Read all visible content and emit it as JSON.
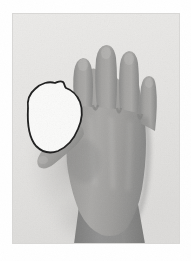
{
  "page": {
    "background_color": "#ffffff",
    "width": 191,
    "height": 261
  },
  "photo": {
    "name": "hand-photograph",
    "left": 12,
    "top": 13,
    "width": 168,
    "height": 231,
    "background_color": "#e6e5e3",
    "background_color_shadow": "#d2d1cf",
    "description": "Dorsal view of a hand, fingers extended upward, thumb to the left, forearm exiting the bottom edge",
    "border_color": "#d8d7d5"
  },
  "subject": {
    "name": "hand",
    "skin_tone_light": "#b0afad",
    "skin_tone_mid": "#9b9a98",
    "skin_tone_dark": "#808080",
    "skin_tone_shadow": "#6e6e6e",
    "forearm_tone": "#8b8b8b",
    "orientation": "dorsal",
    "side": "left",
    "fingers": [
      {
        "name": "index-finger",
        "label": "index"
      },
      {
        "name": "middle-finger",
        "label": "middle"
      },
      {
        "name": "ring-finger",
        "label": "ring"
      },
      {
        "name": "little-finger",
        "label": "little"
      },
      {
        "name": "thumb",
        "label": "thumb"
      }
    ]
  },
  "annotation": {
    "name": "region-outline",
    "type": "hand-drawn closed contour",
    "stroke_color": "#1a1a1a",
    "fill_color": "#fbfbfa",
    "stroke_width": 1.8,
    "location": "first web space, between thumb and index finger",
    "bounds": {
      "x": 20,
      "y": 79,
      "width": 50,
      "height": 62
    },
    "points": "28,108 27,100 29,94 34,89 40,85 47,83 52,84 55,82 58,83 59,86 64,88 69,92 72,97 73,103 72,110 69,118 64,125 58,130 51,133 45,133 39,130 33,124 29,117"
  },
  "caption": {
    "text": "",
    "visible": false
  }
}
